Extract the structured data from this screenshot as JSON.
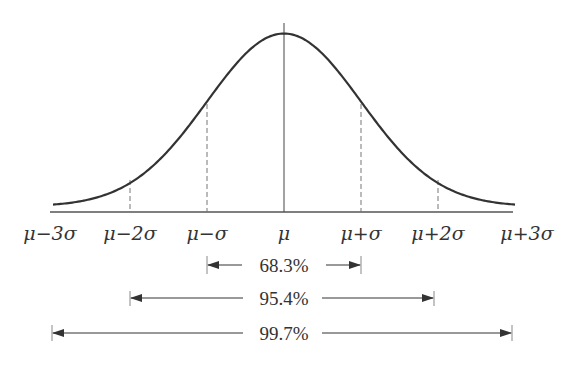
{
  "diagram": {
    "colors": {
      "curve": "#333333",
      "axis": "#555555",
      "dashed": "#666666",
      "text": "#333333",
      "background": "#ffffff"
    },
    "axis_labels": [
      "μ−3σ",
      "μ−2σ",
      "μ−σ",
      "μ",
      "μ+σ",
      "μ+2σ",
      "μ+3σ"
    ],
    "intervals": [
      {
        "label": "68.3%",
        "range": "μ±σ"
      },
      {
        "label": "95.4%",
        "range": "μ±2σ"
      },
      {
        "label": "99.7%",
        "range": "μ±3σ"
      }
    ]
  },
  "chart_data": {
    "type": "line",
    "title": "",
    "xlabel": "",
    "ylabel": "",
    "x": [
      "μ−3σ",
      "μ−2σ",
      "μ−σ",
      "μ",
      "μ+σ",
      "μ+2σ",
      "μ+3σ"
    ],
    "series": [
      {
        "name": "normal density (relative)",
        "values": [
          0.011,
          0.135,
          0.607,
          1.0,
          0.607,
          0.135,
          0.011
        ]
      }
    ],
    "annotations": [
      {
        "text": "68.3%",
        "from": "μ−σ",
        "to": "μ+σ"
      },
      {
        "text": "95.4%",
        "from": "μ−2σ",
        "to": "μ+2σ"
      },
      {
        "text": "99.7%",
        "from": "μ−3σ",
        "to": "μ+3σ"
      }
    ],
    "grid": false,
    "legend": "none"
  }
}
